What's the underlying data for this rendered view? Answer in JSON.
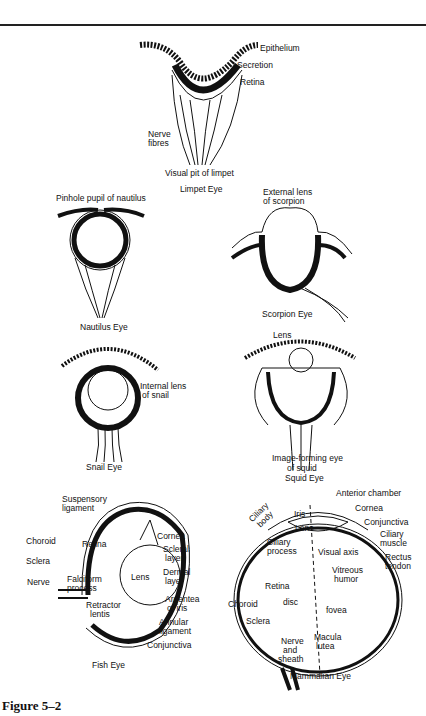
{
  "figure": {
    "label": "Figure 5–2",
    "panels": {
      "limpet": {
        "caption": "Visual pit of limpet",
        "title": "Limpet Eye",
        "labels": [
          "Epithelium",
          "Secretion",
          "Retina",
          "Nerve",
          "fibres"
        ]
      },
      "nautilus": {
        "title": "Nautilus Eye",
        "labels": [
          "Pinhole pupil of nautilus"
        ]
      },
      "scorpion": {
        "title": "Scorpion Eye",
        "labels": [
          "External lens",
          "of scorpion"
        ]
      },
      "snail": {
        "title": "Snail Eye",
        "labels": [
          "Internal lens",
          "of snail"
        ]
      },
      "squid": {
        "caption1": "Image-forming eye",
        "caption2": "of squid",
        "title": "Squid Eye",
        "labels": [
          "Lens"
        ]
      },
      "fish": {
        "title": "Fish Eye",
        "labels": [
          "Suspensory",
          "ligament",
          "Choroid",
          "Retina",
          "Cornea",
          "Scleral",
          "layer",
          "Sclera",
          "Lens",
          "Dermal",
          "layer",
          "Nerve",
          "Falciform",
          "process",
          "Retractor",
          "lentis",
          "Argentea",
          "of iris",
          "Annular",
          "ligament",
          "Conjunctiva"
        ]
      },
      "mammal": {
        "title": "Mammalian Eye",
        "labels": [
          "Anterior chamber",
          "Ciliary",
          "body",
          "Iris",
          "Cornea",
          "Lens",
          "Conjunctiva",
          "Ciliary",
          "muscle",
          "Ciliary",
          "process",
          "Visual axis",
          "Rectus",
          "tendon",
          "Vitreous",
          "humor",
          "Retina",
          "Choroid",
          "disc",
          "fovea",
          "Sclera",
          "Nerve",
          "and",
          "sheath",
          "Macula",
          "lutea"
        ]
      }
    }
  }
}
